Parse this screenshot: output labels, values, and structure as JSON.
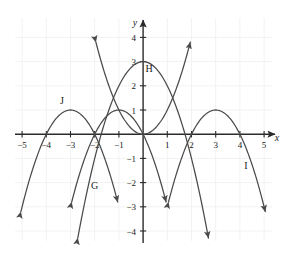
{
  "chart_data": {
    "type": "line",
    "title": "",
    "xlabel": "x",
    "ylabel": "y",
    "xlim": [
      -5.9,
      5.9
    ],
    "ylim": [
      -4.6,
      4.6
    ],
    "grid": true,
    "grid_step": 1,
    "legend_position": "inline-curve-labels",
    "x_ticks": [
      -5,
      -4,
      -3,
      -2,
      -1,
      1,
      2,
      3,
      4,
      5
    ],
    "x_tick_labels": [
      "−5",
      "−4",
      "−3",
      "−2",
      "−1",
      "1",
      "2",
      "3",
      "4",
      "5"
    ],
    "y_ticks": [
      4,
      3,
      2,
      1,
      -1,
      -2,
      -3,
      -4
    ],
    "y_tick_labels": [
      "4",
      "3",
      "2",
      "1",
      "−1",
      "−2",
      "−3",
      "−4"
    ],
    "annotations": [
      {
        "text": "H",
        "x": 0.25,
        "y": 2.55
      },
      {
        "text": "G",
        "x": -2.0,
        "y": -2.25
      },
      {
        "text": "I",
        "x": 4.25,
        "y": -1.45
      },
      {
        "text": "J",
        "x": -3.35,
        "y": 1.25
      }
    ],
    "series": [
      {
        "name": "G",
        "label": "G",
        "type": "parabola",
        "orientation": "opens-down",
        "vertex": [
          -1,
          1
        ],
        "a": -1,
        "roots": [
          -2,
          0
        ],
        "equation": "y = -(x+1)^2 + 1",
        "arrow_start": true,
        "arrow_end": true,
        "x_range": [
          -2.95,
          0.95
        ]
      },
      {
        "name": "H",
        "label": "H",
        "type": "parabola",
        "orientation": "opens-down",
        "vertex": [
          0,
          3
        ],
        "a": -1,
        "roots": [
          -1.732,
          1.732
        ],
        "equation": "y = -x^2 + 3",
        "arrow_start": true,
        "arrow_end": true,
        "x_range": [
          -2.7,
          2.7
        ]
      },
      {
        "name": "I",
        "label": "I",
        "type": "parabola",
        "orientation": "opens-down",
        "vertex": [
          3,
          1
        ],
        "a": -1,
        "roots": [
          2,
          4
        ],
        "equation": "y = -(x-3)^2 + 1",
        "arrow_start": true,
        "arrow_end": true,
        "x_range": [
          1.05,
          5.05
        ]
      },
      {
        "name": "J",
        "label": "J",
        "type": "parabola",
        "orientation": "opens-down",
        "vertex": [
          -3,
          1
        ],
        "a": -1,
        "roots": [
          -4,
          -2
        ],
        "equation": "y = -(x+3)^2 + 1",
        "arrow_start": true,
        "arrow_end": true,
        "x_range": [
          -5.05,
          -1.05
        ]
      },
      {
        "name": "K",
        "label": "",
        "type": "parabola",
        "orientation": "opens-up",
        "vertex": [
          0,
          0
        ],
        "a": 1,
        "roots": [
          0
        ],
        "equation": "y = x^2",
        "arrow_start": true,
        "arrow_end": true,
        "x_range": [
          -1.95,
          1.95
        ]
      }
    ],
    "colors": {
      "curve": "#4a4a4a",
      "axis": "#2b2b2b",
      "grid": "#f2f2f2",
      "background": "#ffffff",
      "text": "#1a1a1a"
    }
  }
}
